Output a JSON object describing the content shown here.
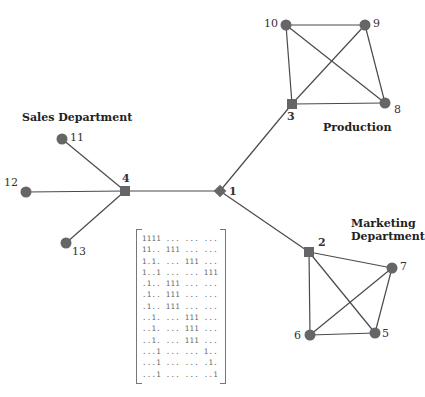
{
  "diagram": {
    "colors": {
      "node": "#666666",
      "edge": "#4a4a4a",
      "text": "#222222"
    },
    "groups": [
      {
        "id": "sales",
        "label": "Sales Department",
        "lines": [
          "Sales Department"
        ]
      },
      {
        "id": "production",
        "label": "Production",
        "lines": [
          "Production"
        ]
      },
      {
        "id": "marketing",
        "label": "Marketing Department",
        "lines": [
          "Marketing",
          "Department"
        ]
      }
    ],
    "nodes": [
      {
        "id": "1",
        "label": "1",
        "shape": "diamond",
        "x": 220,
        "y": 191
      },
      {
        "id": "2",
        "label": "2",
        "shape": "square",
        "x": 309,
        "y": 252
      },
      {
        "id": "3",
        "label": "3",
        "shape": "square",
        "x": 292,
        "y": 104
      },
      {
        "id": "4",
        "label": "4",
        "shape": "square",
        "x": 125,
        "y": 191
      },
      {
        "id": "5",
        "label": "5",
        "shape": "circle",
        "x": 375,
        "y": 333
      },
      {
        "id": "6",
        "label": "6",
        "shape": "circle",
        "x": 310,
        "y": 335
      },
      {
        "id": "7",
        "label": "7",
        "shape": "circle",
        "x": 392,
        "y": 268
      },
      {
        "id": "8",
        "label": "8",
        "shape": "circle",
        "x": 385,
        "y": 103
      },
      {
        "id": "9",
        "label": "9",
        "shape": "circle",
        "x": 365,
        "y": 25
      },
      {
        "id": "10",
        "label": "10",
        "shape": "circle",
        "x": 286,
        "y": 25
      },
      {
        "id": "11",
        "label": "11",
        "shape": "circle",
        "x": 62,
        "y": 139
      },
      {
        "id": "12",
        "label": "12",
        "shape": "circle",
        "x": 26,
        "y": 192
      },
      {
        "id": "13",
        "label": "13",
        "shape": "circle",
        "x": 66,
        "y": 243
      }
    ],
    "edges": [
      [
        "1",
        "4"
      ],
      [
        "1",
        "3"
      ],
      [
        "1",
        "2"
      ],
      [
        "4",
        "11"
      ],
      [
        "4",
        "12"
      ],
      [
        "4",
        "13"
      ],
      [
        "3",
        "10"
      ],
      [
        "3",
        "9"
      ],
      [
        "3",
        "8"
      ],
      [
        "10",
        "9"
      ],
      [
        "10",
        "8"
      ],
      [
        "9",
        "8"
      ],
      [
        "2",
        "7"
      ],
      [
        "2",
        "5"
      ],
      [
        "2",
        "6"
      ],
      [
        "6",
        "5"
      ],
      [
        "6",
        "7"
      ],
      [
        "7",
        "5"
      ]
    ],
    "matrix": {
      "rows": [
        "1111 ... ... ...",
        "11.. 111 ... ...",
        "1.1. ... 111 ...",
        "1..1 ... ... 111",
        ".1.. 111 ... ...",
        ".1.. 111 ... ...",
        ".1.. 111 ... ...",
        "..1. ... 111 ...",
        "..1. ... 111 ...",
        "..1. ... 111 ...",
        "...1 ... ... 1..",
        "...1 ... ... .1.",
        "...1 ... ... ..1"
      ]
    }
  }
}
